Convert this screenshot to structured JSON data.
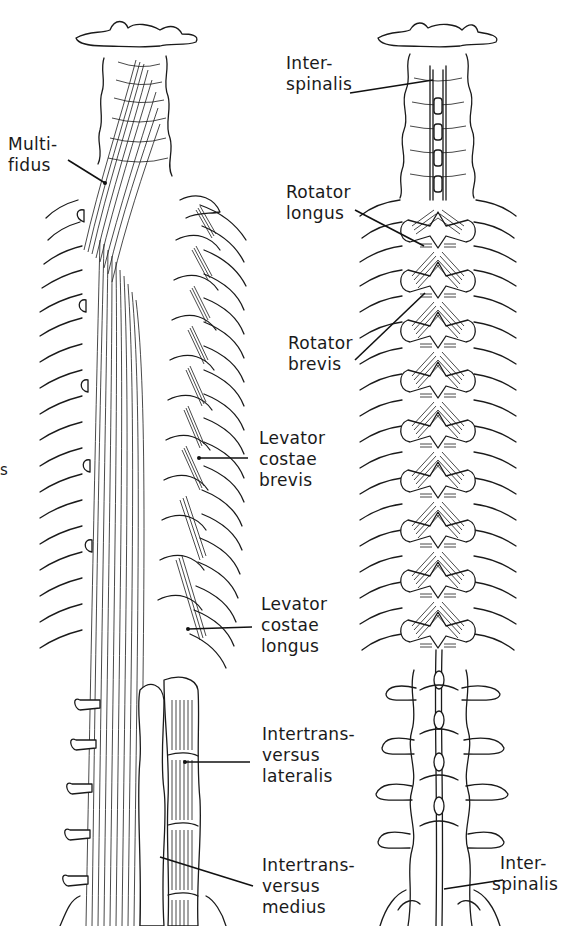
{
  "figure": {
    "panels": [
      {
        "id": "left",
        "description": "Left spine: multifidus, levatores costarum, intertransversarii"
      },
      {
        "id": "right",
        "description": "Right spine: interspinales, rotatores"
      }
    ],
    "edge_fragment": "s"
  },
  "labels": {
    "multifidus": {
      "line1": "Multi-",
      "line2": "fidus"
    },
    "interspinalis_top": {
      "line1": "Inter-",
      "line2": "spinalis"
    },
    "rotator_longus": {
      "line1": "Rotator",
      "line2": "longus"
    },
    "rotator_brevis": {
      "line1": "Rotator",
      "line2": "brevis"
    },
    "levator_costae_brevis": {
      "line1": "Levator",
      "line2": "costae",
      "line3": "brevis"
    },
    "levator_costae_longus": {
      "line1": "Levator",
      "line2": "costae",
      "line3": "longus"
    },
    "intertransversus_lateralis": {
      "line1": "Intertrans-",
      "line2": "versus",
      "line3": "lateralis"
    },
    "intertransversus_medius": {
      "line1": "Intertrans-",
      "line2": "versus",
      "line3": "medius"
    },
    "interspinalis_bottom": {
      "line1": "Inter-",
      "line2": "spinalis"
    }
  },
  "colors": {
    "ink": "#1a1a1a",
    "paper": "#ffffff"
  }
}
